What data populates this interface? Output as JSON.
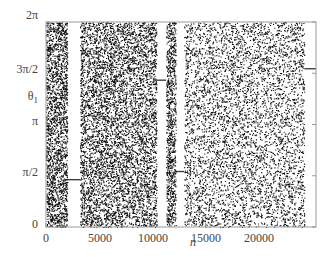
{
  "chart_data": {
    "type": "scatter",
    "title": "",
    "xlabel": "n",
    "ylabel": "θ1",
    "xlim": [
      0,
      25400
    ],
    "ylim": [
      0,
      6.2832
    ],
    "x_ticks": [
      "0",
      "5000",
      "10000",
      "15000",
      "20000"
    ],
    "x_tick_values": [
      0,
      5000,
      10000,
      15000,
      20000
    ],
    "y_ticks": [
      "0",
      "π/2",
      "π",
      "3π/2",
      "2π"
    ],
    "y_tick_values": [
      0,
      1.5708,
      3.1416,
      4.7124,
      6.2832
    ],
    "grid": false,
    "legend": null,
    "chaotic_ranges_n": [
      [
        0,
        2000
      ],
      [
        3200,
        10400
      ],
      [
        11300,
        12200
      ],
      [
        13000,
        24300
      ]
    ],
    "constant_segments": [
      {
        "n_start": 2000,
        "n_end": 3200,
        "theta": 1.45
      },
      {
        "n_start": 10400,
        "n_end": 11300,
        "theta": 4.5
      },
      {
        "n_start": 12200,
        "n_end": 13000,
        "theta": 1.7
      },
      {
        "n_start": 24300,
        "n_end": 25400,
        "theta": 4.85
      }
    ],
    "point_color": "#111111"
  },
  "labels": {
    "y0": "0",
    "y1": "π/2",
    "y2": "π",
    "y3": "3π/2",
    "y4": "2π",
    "ytitle": "θ",
    "ytitle_sub": "1",
    "x0": "0",
    "x1": "5000",
    "x2": "10000",
    "x3": "15000",
    "x4": "20000",
    "xtitle": "n"
  }
}
